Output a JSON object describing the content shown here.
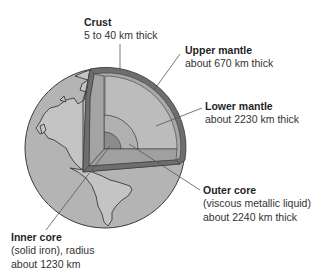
{
  "diagram": {
    "colors": {
      "globe_fill": "#b4b4b4",
      "land_outline": "#3a3a3a",
      "crust_band": "#6e6e6e",
      "upper_mantle": "#a8a8a8",
      "lower_mantle": "#bcbcbc",
      "outer_core": "#b0b0b0",
      "inner_core": "#8c8c8c",
      "leader_line": "#555555",
      "text": "#1f1f1f"
    },
    "layers": [
      {
        "id": "crust",
        "title": "Crust",
        "lines": [
          "5 to 40 km thick"
        ]
      },
      {
        "id": "upper_mantle",
        "title": "Upper mantle",
        "lines": [
          "about 670 km thick"
        ]
      },
      {
        "id": "lower_mantle",
        "title": "Lower mantle",
        "lines": [
          "about 2230 km thick"
        ]
      },
      {
        "id": "outer_core",
        "title": "Outer core",
        "lines": [
          "(viscous metallic liquid)",
          "about 2240 km thick"
        ]
      },
      {
        "id": "inner_core",
        "title": "Inner core",
        "lines": [
          "(solid iron), radius",
          "about 1230 km"
        ]
      }
    ]
  }
}
